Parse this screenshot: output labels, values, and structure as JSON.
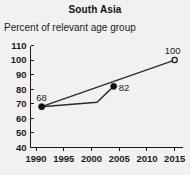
{
  "chart_data": {
    "type": "line",
    "title": "South Asia",
    "subtitle": "Percent of relevant age group",
    "xlabel": "",
    "ylabel": "",
    "xlim": [
      1989,
      2016.5
    ],
    "ylim": [
      40,
      110
    ],
    "grid": false,
    "legend": "none",
    "x_ticks": [
      "1990",
      "1995",
      "2000",
      "2005",
      "2010",
      "2015"
    ],
    "x_tick_values": [
      1990,
      1995,
      2000,
      2005,
      2010,
      2015
    ],
    "y_ticks": [
      "110",
      "100",
      "90",
      "80",
      "70",
      "60",
      "50",
      "40"
    ],
    "y_tick_values": [
      110,
      100,
      90,
      80,
      70,
      60,
      50,
      40
    ],
    "series": [
      {
        "name": "observed",
        "marker": "filled-circle",
        "x": [
          1991,
          1996,
          2001,
          2004
        ],
        "values": [
          68,
          69.5,
          71,
          82
        ]
      },
      {
        "name": "trend-to-target",
        "marker": "open-circle",
        "x": [
          1991,
          2015
        ],
        "values": [
          68,
          100
        ]
      }
    ],
    "annotations": [
      {
        "text": "68",
        "x": 1991,
        "y": 68,
        "position": "above"
      },
      {
        "text": "82",
        "x": 2004,
        "y": 82,
        "position": "right"
      },
      {
        "text": "100",
        "x": 2015,
        "y": 100,
        "position": "above-left"
      }
    ]
  }
}
